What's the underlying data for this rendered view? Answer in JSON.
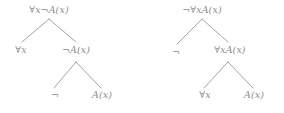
{
  "figure": {
    "background_color": "#ffffff",
    "text_color": "#8d8d8d",
    "edge_color": "#9a9a9a"
  },
  "trees": [
    {
      "id": "left-tree",
      "name": "tree-forall-x-not-A-x",
      "root_formula": "∀x¬A(x)",
      "nodes": [
        {
          "id": "L0",
          "label": "∀x¬A(x)",
          "level": 0,
          "x": 49,
          "y": 9
        },
        {
          "id": "L1",
          "label": "∀x",
          "level": 1,
          "x": 21,
          "y": 49
        },
        {
          "id": "L2",
          "label": "¬A(x)",
          "level": 1,
          "x": 76,
          "y": 49
        },
        {
          "id": "L3",
          "label": "¬",
          "level": 2,
          "x": 55,
          "y": 94
        },
        {
          "id": "L4",
          "label": "A(x)",
          "level": 2,
          "x": 102,
          "y": 94
        }
      ],
      "edges": [
        {
          "from": "L0",
          "to": "L1",
          "x1": 49,
          "y1": 19,
          "x2": 22,
          "y2": 42
        },
        {
          "from": "L0",
          "to": "L2",
          "x1": 49,
          "y1": 19,
          "x2": 76,
          "y2": 42
        },
        {
          "from": "L2",
          "to": "L3",
          "x1": 76,
          "y1": 62,
          "x2": 54,
          "y2": 88
        },
        {
          "from": "L2",
          "to": "L4",
          "x1": 76,
          "y1": 62,
          "x2": 101,
          "y2": 88
        }
      ]
    },
    {
      "id": "right-tree",
      "name": "tree-not-forall-x-A-x",
      "root_formula": "¬∀xA(x)",
      "nodes": [
        {
          "id": "R0",
          "label": "¬∀xA(x)",
          "level": 0,
          "x": 60,
          "y": 9
        },
        {
          "id": "R1",
          "label": "¬",
          "level": 1,
          "x": 34,
          "y": 51
        },
        {
          "id": "R2",
          "label": "∀xA(x)",
          "level": 1,
          "x": 88,
          "y": 49
        },
        {
          "id": "R3",
          "label": "∀x",
          "level": 2,
          "x": 63,
          "y": 94
        },
        {
          "id": "R4",
          "label": "A(x)",
          "level": 2,
          "x": 112,
          "y": 94
        }
      ],
      "edges": [
        {
          "from": "R0",
          "to": "R1",
          "x1": 60,
          "y1": 19,
          "x2": 35,
          "y2": 44
        },
        {
          "from": "R0",
          "to": "R2",
          "x1": 60,
          "y1": 19,
          "x2": 86,
          "y2": 42
        },
        {
          "from": "R2",
          "to": "R3",
          "x1": 86,
          "y1": 62,
          "x2": 62,
          "y2": 88
        },
        {
          "from": "R2",
          "to": "R4",
          "x1": 86,
          "y1": 62,
          "x2": 111,
          "y2": 88
        }
      ]
    }
  ]
}
